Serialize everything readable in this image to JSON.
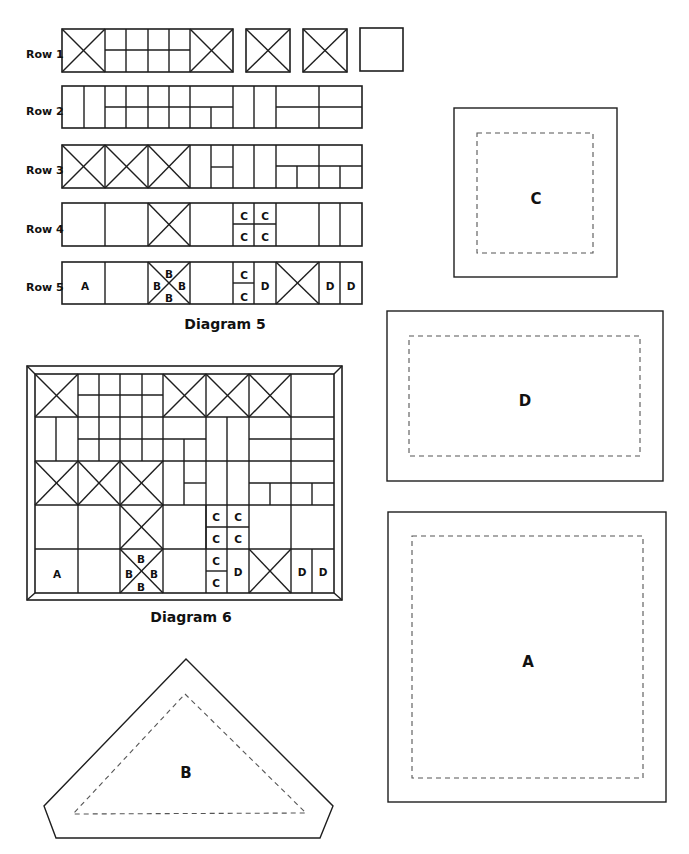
{
  "diagram5": {
    "caption": "Diagram 5",
    "row_labels": [
      {
        "text": "Row 1",
        "x": 26,
        "y": 55
      },
      {
        "text": "Row 2",
        "x": 26,
        "y": 112
      },
      {
        "text": "Row 3",
        "x": 26,
        "y": 171
      },
      {
        "text": "Row 4",
        "x": 26,
        "y": 230
      },
      {
        "text": "Row 5",
        "x": 26,
        "y": 288
      }
    ],
    "rects": [
      [
        62,
        29,
        171,
        43
      ],
      [
        246,
        29,
        44,
        43
      ],
      [
        303,
        29,
        44,
        43
      ],
      [
        360,
        28,
        43,
        43
      ],
      [
        62,
        86,
        300,
        42
      ],
      [
        62,
        145,
        300,
        43
      ],
      [
        62,
        203,
        300,
        43
      ],
      [
        62,
        262,
        300,
        42
      ]
    ],
    "lines": [
      [
        105,
        29,
        105,
        72
      ],
      [
        190,
        29,
        190,
        72
      ],
      [
        105,
        50,
        190,
        50
      ],
      [
        126,
        29,
        126,
        72
      ],
      [
        148,
        29,
        148,
        72
      ],
      [
        169,
        29,
        169,
        72
      ],
      [
        62,
        29,
        105,
        72
      ],
      [
        105,
        29,
        62,
        72
      ],
      [
        190,
        29,
        233,
        72
      ],
      [
        233,
        29,
        190,
        72
      ],
      [
        246,
        29,
        290,
        72
      ],
      [
        290,
        29,
        246,
        72
      ],
      [
        303,
        29,
        347,
        72
      ],
      [
        347,
        29,
        303,
        72
      ],
      [
        84,
        86,
        84,
        128
      ],
      [
        105,
        86,
        105,
        128
      ],
      [
        126,
        86,
        126,
        128
      ],
      [
        148,
        86,
        148,
        128
      ],
      [
        169,
        86,
        169,
        128
      ],
      [
        190,
        86,
        190,
        128
      ],
      [
        105,
        107,
        233,
        107
      ],
      [
        211,
        107,
        211,
        128
      ],
      [
        233,
        86,
        233,
        128
      ],
      [
        254,
        86,
        254,
        128
      ],
      [
        276,
        86,
        276,
        128
      ],
      [
        319,
        86,
        319,
        128
      ],
      [
        276,
        107,
        362,
        107
      ],
      [
        105,
        145,
        105,
        188
      ],
      [
        148,
        145,
        148,
        188
      ],
      [
        190,
        145,
        190,
        188
      ],
      [
        62,
        145,
        105,
        188
      ],
      [
        105,
        145,
        62,
        188
      ],
      [
        105,
        145,
        148,
        188
      ],
      [
        148,
        145,
        105,
        188
      ],
      [
        148,
        145,
        190,
        188
      ],
      [
        190,
        145,
        148,
        188
      ],
      [
        211,
        145,
        211,
        188
      ],
      [
        211,
        167,
        233,
        167
      ],
      [
        233,
        145,
        233,
        188
      ],
      [
        254,
        145,
        254,
        188
      ],
      [
        276,
        145,
        276,
        188
      ],
      [
        276,
        166,
        362,
        166
      ],
      [
        297,
        166,
        297,
        188
      ],
      [
        319,
        145,
        319,
        188
      ],
      [
        340,
        166,
        340,
        188
      ],
      [
        105,
        203,
        105,
        246
      ],
      [
        148,
        203,
        148,
        246
      ],
      [
        190,
        203,
        190,
        246
      ],
      [
        233,
        203,
        233,
        246
      ],
      [
        254,
        203,
        254,
        246
      ],
      [
        276,
        203,
        276,
        246
      ],
      [
        148,
        203,
        190,
        246
      ],
      [
        190,
        203,
        148,
        246
      ],
      [
        233,
        224,
        276,
        224
      ],
      [
        319,
        203,
        319,
        246
      ],
      [
        340,
        203,
        340,
        246
      ],
      [
        105,
        262,
        105,
        304
      ],
      [
        148,
        262,
        148,
        304
      ],
      [
        190,
        262,
        190,
        304
      ],
      [
        233,
        262,
        233,
        304
      ],
      [
        254,
        262,
        254,
        304
      ],
      [
        148,
        262,
        190,
        304
      ],
      [
        190,
        262,
        148,
        304
      ],
      [
        233,
        283,
        254,
        283
      ],
      [
        276,
        262,
        276,
        304
      ],
      [
        276,
        262,
        319,
        304
      ],
      [
        319,
        262,
        276,
        304
      ],
      [
        319,
        262,
        319,
        304
      ],
      [
        340,
        262,
        340,
        304
      ]
    ],
    "cell_labels": [
      {
        "text": "C",
        "x": 244,
        "y": 217
      },
      {
        "text": "C",
        "x": 265,
        "y": 217
      },
      {
        "text": "C",
        "x": 244,
        "y": 238
      },
      {
        "text": "C",
        "x": 265,
        "y": 238
      },
      {
        "text": "A",
        "x": 85,
        "y": 287
      },
      {
        "text": "B",
        "x": 169,
        "y": 275
      },
      {
        "text": "B",
        "x": 157,
        "y": 287
      },
      {
        "text": "B",
        "x": 182,
        "y": 287
      },
      {
        "text": "B",
        "x": 169,
        "y": 299
      },
      {
        "text": "C",
        "x": 244,
        "y": 276
      },
      {
        "text": "C",
        "x": 244,
        "y": 298
      },
      {
        "text": "D",
        "x": 265,
        "y": 287
      },
      {
        "text": "D",
        "x": 330,
        "y": 287
      },
      {
        "text": "D",
        "x": 351,
        "y": 287
      }
    ]
  },
  "diagram6": {
    "caption": "Diagram 6",
    "outer": [
      27,
      366,
      315,
      234
    ],
    "inner": [
      35,
      374,
      299,
      219
    ],
    "lines": [
      [
        27,
        366,
        35,
        374
      ],
      [
        342,
        366,
        334,
        374
      ],
      [
        27,
        600,
        35,
        593
      ],
      [
        342,
        600,
        334,
        593
      ],
      [
        35,
        417,
        334,
        417
      ],
      [
        35,
        461,
        334,
        461
      ],
      [
        35,
        505,
        334,
        505
      ],
      [
        35,
        549,
        334,
        549
      ],
      [
        78,
        374,
        78,
        417
      ],
      [
        35,
        374,
        78,
        417
      ],
      [
        78,
        374,
        35,
        417
      ],
      [
        99,
        374,
        99,
        461
      ],
      [
        120,
        374,
        120,
        461
      ],
      [
        142,
        374,
        142,
        461
      ],
      [
        78,
        395,
        163,
        395
      ],
      [
        78,
        439,
        163,
        439
      ],
      [
        163,
        374,
        163,
        417
      ],
      [
        163,
        374,
        206,
        417
      ],
      [
        206,
        374,
        163,
        417
      ],
      [
        206,
        374,
        206,
        417
      ],
      [
        206,
        374,
        249,
        417
      ],
      [
        249,
        374,
        206,
        417
      ],
      [
        249,
        374,
        249,
        417
      ],
      [
        249,
        374,
        291,
        417
      ],
      [
        291,
        374,
        249,
        417
      ],
      [
        291,
        374,
        291,
        417
      ],
      [
        56,
        417,
        56,
        461
      ],
      [
        78,
        417,
        78,
        461
      ],
      [
        163,
        417,
        163,
        461
      ],
      [
        163,
        439,
        206,
        439
      ],
      [
        184,
        439,
        184,
        505
      ],
      [
        206,
        417,
        206,
        549
      ],
      [
        227,
        417,
        227,
        505
      ],
      [
        249,
        417,
        249,
        505
      ],
      [
        249,
        439,
        334,
        439
      ],
      [
        291,
        417,
        291,
        505
      ],
      [
        249,
        483,
        334,
        483
      ],
      [
        270,
        483,
        270,
        505
      ],
      [
        312,
        483,
        312,
        505
      ],
      [
        184,
        483,
        206,
        483
      ],
      [
        78,
        461,
        78,
        505
      ],
      [
        120,
        461,
        120,
        505
      ],
      [
        163,
        461,
        163,
        505
      ],
      [
        35,
        461,
        78,
        505
      ],
      [
        78,
        461,
        35,
        505
      ],
      [
        78,
        461,
        120,
        505
      ],
      [
        120,
        461,
        78,
        505
      ],
      [
        120,
        461,
        163,
        505
      ],
      [
        163,
        461,
        120,
        505
      ],
      [
        78,
        505,
        78,
        593
      ],
      [
        120,
        505,
        120,
        593
      ],
      [
        163,
        505,
        163,
        593
      ],
      [
        206,
        505,
        206,
        593
      ],
      [
        227,
        505,
        227,
        593
      ],
      [
        249,
        505,
        249,
        593
      ],
      [
        120,
        505,
        163,
        549
      ],
      [
        163,
        505,
        120,
        549
      ],
      [
        206,
        527,
        249,
        527
      ],
      [
        291,
        505,
        291,
        593
      ],
      [
        120,
        549,
        163,
        593
      ],
      [
        163,
        549,
        120,
        593
      ],
      [
        206,
        571,
        227,
        571
      ],
      [
        249,
        549,
        291,
        593
      ],
      [
        291,
        549,
        249,
        593
      ],
      [
        312,
        549,
        312,
        593
      ]
    ],
    "cell_labels": [
      {
        "text": "C",
        "x": 216,
        "y": 518
      },
      {
        "text": "C",
        "x": 238,
        "y": 518
      },
      {
        "text": "C",
        "x": 216,
        "y": 540
      },
      {
        "text": "C",
        "x": 238,
        "y": 540
      },
      {
        "text": "A",
        "x": 57,
        "y": 575
      },
      {
        "text": "B",
        "x": 141,
        "y": 560
      },
      {
        "text": "B",
        "x": 129,
        "y": 575
      },
      {
        "text": "B",
        "x": 154,
        "y": 575
      },
      {
        "text": "B",
        "x": 141,
        "y": 588
      },
      {
        "text": "C",
        "x": 216,
        "y": 562
      },
      {
        "text": "C",
        "x": 216,
        "y": 584
      },
      {
        "text": "D",
        "x": 238,
        "y": 573
      },
      {
        "text": "D",
        "x": 302,
        "y": 573
      },
      {
        "text": "D",
        "x": 323,
        "y": 573
      }
    ]
  },
  "templates": [
    {
      "id": "C",
      "label": "C",
      "outer": [
        454,
        108,
        163,
        169
      ],
      "inner": [
        477,
        133,
        116,
        120
      ],
      "lx": 536,
      "ly": 199
    },
    {
      "id": "D",
      "label": "D",
      "outer": [
        387,
        311,
        276,
        170
      ],
      "inner": [
        409,
        336,
        231,
        120
      ],
      "lx": 525,
      "ly": 401
    },
    {
      "id": "A",
      "label": "A",
      "outer": [
        388,
        512,
        278,
        290
      ],
      "inner": [
        412,
        536,
        231,
        242
      ],
      "lx": 528,
      "ly": 662
    }
  ],
  "template_b": {
    "label": "B",
    "outer": "186,659 333,806 320,838 56,838 44,806",
    "inner": "185,694 306,813 73,814",
    "lx": 186,
    "ly": 773
  }
}
